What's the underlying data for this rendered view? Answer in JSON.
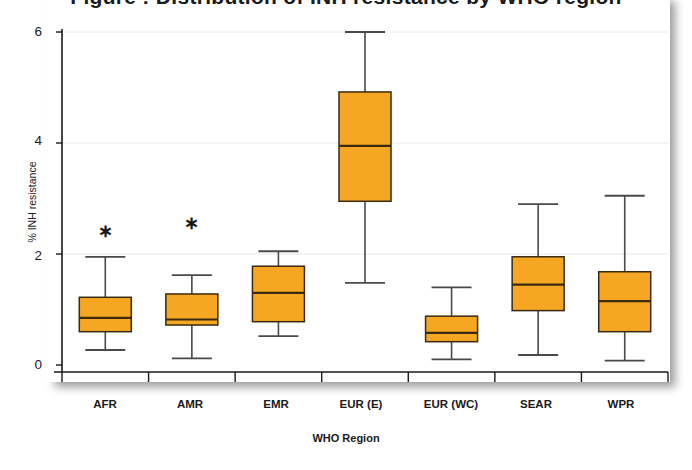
{
  "figure": {
    "title_partial": "Figure : Distribution of INH resistance by WHO region",
    "background": "#ffffff",
    "box_fill": "#F5A623",
    "box_stroke": "#3a2a10",
    "whisker_color": "#4a4a4a",
    "axis_color": "#1a1a1a",
    "grid_color": "#e8e8e8"
  },
  "chart_data": {
    "type": "box",
    "title": "Figure : Distribution of INH resistance by WHO region",
    "xlabel": "WHO Region",
    "ylabel": "% INH resistance",
    "ylim": [
      0,
      6
    ],
    "yticks": [
      "0",
      "2",
      "4",
      "6"
    ],
    "ytick_values": [
      0,
      2,
      4,
      6
    ],
    "grid": true,
    "legend": "none",
    "categories": [
      "AFR",
      "AMR",
      "EMR",
      "EUR (E)",
      "EUR (WC)",
      "SEAR",
      "WPR"
    ],
    "boxes": [
      {
        "category": "AFR",
        "whisker_low": 0.27,
        "q1": 0.6,
        "median": 0.85,
        "q3": 1.22,
        "whisker_high": 1.95,
        "outliers": [
          2.42
        ]
      },
      {
        "category": "AMR",
        "whisker_low": 0.12,
        "q1": 0.72,
        "median": 0.82,
        "q3": 1.28,
        "whisker_high": 1.62,
        "outliers": [
          2.55
        ]
      },
      {
        "category": "EMR",
        "whisker_low": 0.52,
        "q1": 0.78,
        "median": 1.3,
        "q3": 1.78,
        "whisker_high": 2.05,
        "outliers": []
      },
      {
        "category": "EUR (E)",
        "whisker_low": 1.48,
        "q1": 2.95,
        "median": 3.95,
        "q3": 4.92,
        "whisker_high": 6.0,
        "outliers": []
      },
      {
        "category": "EUR (WC)",
        "whisker_low": 0.1,
        "q1": 0.42,
        "median": 0.58,
        "q3": 0.88,
        "whisker_high": 1.4,
        "outliers": []
      },
      {
        "category": "SEAR",
        "whisker_low": 0.18,
        "q1": 0.98,
        "median": 1.45,
        "q3": 1.95,
        "whisker_high": 2.9,
        "outliers": []
      },
      {
        "category": "WPR",
        "whisker_low": 0.08,
        "q1": 0.6,
        "median": 1.15,
        "q3": 1.68,
        "whisker_high": 3.05,
        "outliers": []
      }
    ]
  }
}
